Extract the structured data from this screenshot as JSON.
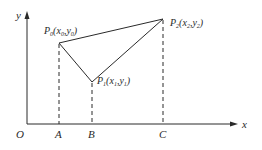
{
  "diagram": {
    "axes": {
      "x_label": "x",
      "y_label": "y",
      "origin_label": "O"
    },
    "points": [
      {
        "name": "P",
        "sub": "0",
        "coord_x": "x",
        "coord_x_sub": "0",
        "coord_y": "y",
        "coord_y_sub": "0",
        "foot": "A"
      },
      {
        "name": "P",
        "sub": "1",
        "coord_x": "x",
        "coord_x_sub": "1",
        "coord_y": "y",
        "coord_y_sub": "1",
        "foot": "B"
      },
      {
        "name": "P",
        "sub": "2",
        "coord_x": "x",
        "coord_x_sub": "2",
        "coord_y": "y",
        "coord_y_sub": "2",
        "foot": "C"
      }
    ],
    "foot_labels": [
      "A",
      "B",
      "C"
    ],
    "colors": {
      "line": "#2a2a2a",
      "background": "#ffffff"
    }
  }
}
